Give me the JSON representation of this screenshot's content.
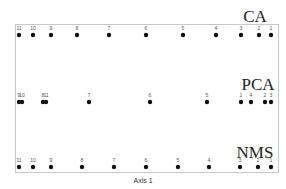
{
  "chart_data": {
    "type": "scatter",
    "title": "",
    "xlabel": "Axis 1",
    "ylabel": "",
    "grid": false,
    "legend": null,
    "series": [
      {
        "name": "CA",
        "points": [
          {
            "label": "11",
            "x": 19
          },
          {
            "label": "10",
            "x": 33
          },
          {
            "label": "9",
            "x": 51
          },
          {
            "label": "8",
            "x": 77
          },
          {
            "label": "7",
            "x": 109
          },
          {
            "label": "6",
            "x": 146
          },
          {
            "label": "5",
            "x": 183
          },
          {
            "label": "4",
            "x": 216
          },
          {
            "label": "3",
            "x": 241
          },
          {
            "label": "2",
            "x": 259
          },
          {
            "label": "1",
            "x": 271
          }
        ]
      },
      {
        "name": "PCA",
        "points": [
          {
            "label": "9",
            "x": 19
          },
          {
            "label": "10",
            "x": 22
          },
          {
            "label": "8",
            "x": 43
          },
          {
            "label": "11",
            "x": 46
          },
          {
            "label": "7",
            "x": 89
          },
          {
            "label": "6",
            "x": 150
          },
          {
            "label": "5",
            "x": 207
          },
          {
            "label": "1",
            "x": 241
          },
          {
            "label": "4",
            "x": 251
          },
          {
            "label": "2",
            "x": 265
          },
          {
            "label": "3",
            "x": 271
          }
        ]
      },
      {
        "name": "NMS",
        "points": [
          {
            "label": "11",
            "x": 19
          },
          {
            "label": "10",
            "x": 33
          },
          {
            "label": "9",
            "x": 51
          },
          {
            "label": "8",
            "x": 82
          },
          {
            "label": "7",
            "x": 114
          },
          {
            "label": "6",
            "x": 146
          },
          {
            "label": "5",
            "x": 178
          },
          {
            "label": "4",
            "x": 209
          },
          {
            "label": "3",
            "x": 240
          },
          {
            "label": "2",
            "x": 258
          },
          {
            "label": "1",
            "x": 271
          }
        ]
      }
    ]
  },
  "labels": {
    "ca": "CA",
    "pca": "PCA",
    "nms": "NMS",
    "axis": "Axis 1"
  }
}
